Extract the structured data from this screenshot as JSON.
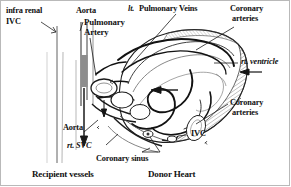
{
  "figure": {
    "kind": "anatomical-illustration",
    "ink_color": "#111111",
    "paper_color": "#ffffff",
    "border_color": "#b9b9b9",
    "width": 291,
    "height": 187
  },
  "labels": {
    "infra_renal": "infra renal",
    "ivc_left": "IVC",
    "aorta_top": "Aorta",
    "pulmonary": "Pulmonary",
    "artery": "Artery",
    "lt_prefix": "lt.",
    "pulmonary_veins": "Pulmonary Veins",
    "coronary_top": "Coronary",
    "arteries_top": "arteries",
    "rt_ventricle": "rt. ventricle",
    "coronary_right": "Coronary",
    "arteries_right": "arteries",
    "ivc_right": "IVC",
    "aorta_bottom": "Aorta",
    "rt_svc": "rt. SVC",
    "coronary_sinus": "Coronary sinus",
    "caption_left": "Recipient vessels",
    "caption_right": "Donor Heart"
  }
}
